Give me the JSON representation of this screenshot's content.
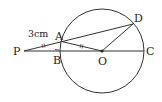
{
  "diagram": {
    "type": "geometry-circle",
    "points": {
      "P": {
        "label": "P",
        "x": 24,
        "y": 51
      },
      "A": {
        "label": "A",
        "x": 62,
        "y": 41
      },
      "B": {
        "label": "B",
        "x": 61,
        "y": 51
      },
      "O": {
        "label": "O",
        "x": 102,
        "y": 51
      },
      "C": {
        "label": "C",
        "x": 144,
        "y": 51
      },
      "D": {
        "label": "D",
        "x": 133,
        "y": 24
      }
    },
    "circle": {
      "center": "O",
      "radius": 42
    },
    "segments": [
      "PD",
      "PC",
      "AO",
      "OD"
    ],
    "measure_label": "3cm",
    "equal_marks": [
      "PA",
      "AO"
    ],
    "colors": {
      "stroke": "#333333",
      "text": "#222222"
    }
  }
}
